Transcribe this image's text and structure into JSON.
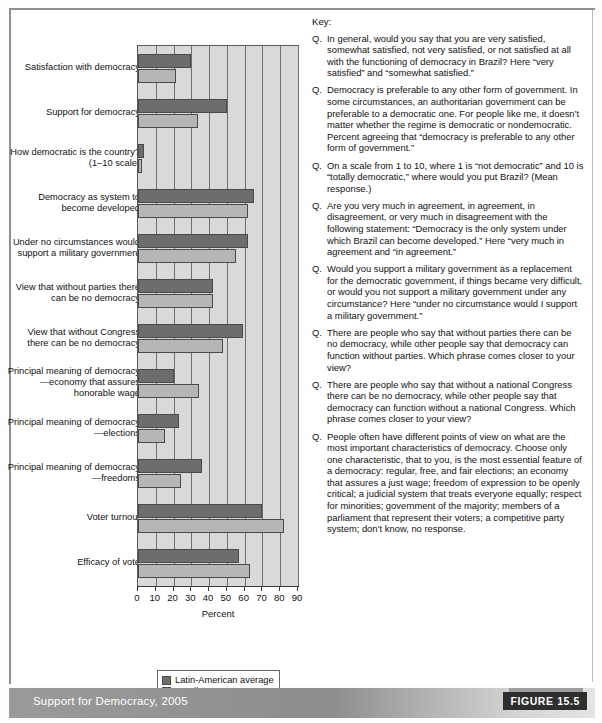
{
  "figure": {
    "footer_title": "Support for Democracy, 2005",
    "figure_tag": "FIGURE 15.5"
  },
  "key": {
    "title": "Key:",
    "marker": "Q.",
    "items": [
      "In general, would you say that you are very satisfied, somewhat satisfied, not very satisfied, or not satisfied at all with the functioning of democracy in Brazil? Here “very satisfied” and “somewhat satisfied.”",
      "Democracy is preferable to any other form of government. In some circumstances, an authoritarian government can be preferable to a democratic one. For people like me, it doesn’t matter whether the regime is democratic or nondemocratic. Percent agreeing that “democracy is preferable to any other form of government.”",
      "On a scale from 1 to 10, where 1 is “not democratic” and 10 is “totally democratic,” where would you put Brazil? (Mean response.)",
      "Are you very much in agreement, in agreement, in disagreement, or very much in disagreement with the following statement: “Democracy is the only system under which Brazil can become developed.” Here “very much in agreement and “in agreement.”",
      "Would you support a military government as a replacement for the democratic government, if things became very difficult, or would you not support a military government under any circumstance? Here “under no circumstance would I support a military government.”",
      "There are people who say that without parties there can be no democracy, while other people say that democracy can function without parties. Which phrase comes closer to your view?",
      "There are people who say that without a national Congress there can be no democracy, while other people say that democracy can function without a national Congress. Which phrase comes closer to your view?",
      "People often have different points of view on what are the most important characteristics of democracy. Choose only one characteristic, that to you, is the most essential feature of a democracy: regular, free, and fair elections; an economy that assures a just wage; freedom of expression to be openly critical; a judicial system that treats everyone equally; respect for minorities; government of the majority; members of a parliament that represent their voters; a competitive party system; don’t know, no response."
    ]
  },
  "chart_data": {
    "type": "bar",
    "orientation": "horizontal",
    "title": "Support for Democracy, 2005",
    "xlabel": "Percent",
    "ylabel": "",
    "xlim": [
      0,
      90
    ],
    "xticks": [
      0,
      10,
      20,
      30,
      40,
      50,
      60,
      70,
      80,
      90
    ],
    "grid": true,
    "legend_position": "bottom",
    "categories": [
      "Satisfaction with democracy",
      "Support for democracy",
      "How democratic is the country? (1–10 scale)",
      "Democracy as system to become developed",
      "Under no circumstances would support a military government",
      "View that without parties there can be no democracy",
      "View that without Congress there can be no democracy",
      "Principal meaning of democracy—economy that assures honorable wage",
      "Principal meaning of democracy—elections",
      "Principal meaning of democracy—freedoms",
      "Voter turnout",
      "Efficacy of vote"
    ],
    "series": [
      {
        "name": "Latin-American average",
        "color": "#6d6d6d",
        "values": [
          30,
          50,
          3.4,
          65,
          62,
          42,
          59,
          20,
          23,
          36,
          70,
          57
        ]
      },
      {
        "name": "Brazil",
        "color": "#b6b6b6",
        "values": [
          21.5,
          34,
          2.3,
          62,
          55,
          42,
          48,
          34.5,
          15,
          24,
          82,
          63
        ]
      }
    ]
  }
}
